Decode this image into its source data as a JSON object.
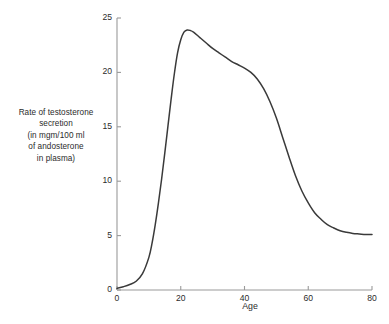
{
  "chart_data": {
    "type": "line",
    "title": "",
    "xlabel": "Age",
    "ylabel": "Rate of testosterone secretion (in mgm/100 ml of andosterone in plasma)",
    "ylabel_lines": [
      "Rate of testosterone",
      "secretion",
      "(in mgm/100 ml",
      "of andosterone",
      "in plasma)"
    ],
    "xlim": [
      0,
      80
    ],
    "ylim": [
      0,
      25
    ],
    "xticks": [
      0,
      20,
      40,
      60,
      80
    ],
    "xtick_labels": [
      "0",
      "20",
      "40",
      "60",
      "80"
    ],
    "yticks": [
      0,
      5,
      10,
      15,
      20,
      25
    ],
    "ytick_labels": [
      "0",
      "5",
      "10",
      "15",
      "20",
      "25"
    ],
    "grid": false,
    "legend": false,
    "legend_position": "none",
    "line_color": "#3a3a3a",
    "axis_color": "#9a9a9a",
    "background_color": "#ffffff",
    "series": [
      {
        "name": "Rate of testosterone secretion",
        "x": [
          0,
          2,
          4,
          6,
          8,
          10,
          11,
          12,
          13,
          14,
          15,
          16,
          17,
          18,
          19,
          20,
          21,
          22,
          23,
          24,
          26,
          28,
          30,
          32,
          34,
          36,
          38,
          40,
          42,
          44,
          46,
          48,
          50,
          52,
          54,
          56,
          58,
          60,
          62,
          64,
          66,
          68,
          70,
          72,
          74,
          76,
          78,
          80
        ],
        "y": [
          0.15,
          0.3,
          0.5,
          0.8,
          1.5,
          3.0,
          4.3,
          6.0,
          8.0,
          10.2,
          12.6,
          15.1,
          17.6,
          19.9,
          21.8,
          23.0,
          23.7,
          23.9,
          23.85,
          23.7,
          23.2,
          22.7,
          22.2,
          21.8,
          21.4,
          21.0,
          20.7,
          20.4,
          20.0,
          19.4,
          18.5,
          17.3,
          15.8,
          14.0,
          12.2,
          10.5,
          9.1,
          8.0,
          7.1,
          6.5,
          6.0,
          5.7,
          5.45,
          5.3,
          5.2,
          5.15,
          5.1,
          5.1
        ]
      }
    ],
    "annotations": [],
    "peak": {
      "x": 22,
      "y": 23.9
    },
    "plateau_value": 5.1
  },
  "axes": {
    "x_title": "Age"
  }
}
